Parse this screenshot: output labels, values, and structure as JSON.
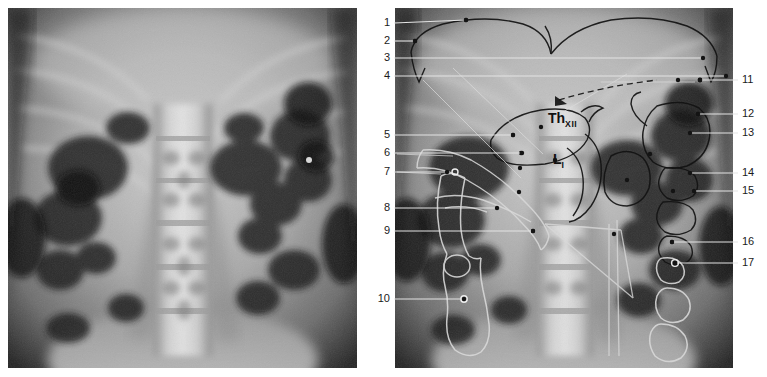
{
  "figure": {
    "type": "medical-radiograph-pair",
    "background_color": "#ffffff",
    "line_color": "#e8e8e8",
    "number_color": "#1b1b1b"
  },
  "panels": {
    "left": {
      "name": "plain-radiograph",
      "x": 8,
      "y": 8,
      "width": 349,
      "height": 360,
      "has_overlay": false
    },
    "right": {
      "name": "annotated-radiograph",
      "x": 395,
      "y": 8,
      "width": 338,
      "height": 360,
      "has_overlay": true
    }
  },
  "vertebral_labels": [
    {
      "id": "thxii",
      "base": "Th",
      "subscript": "XII",
      "x": 548,
      "y": 111
    },
    {
      "id": "li",
      "base": "L",
      "subscript": "I",
      "x": 553,
      "y": 152
    }
  ],
  "leader_labels": {
    "left_column": [
      {
        "number": "1",
        "num_x": 390,
        "num_y": 23,
        "line": [
          [
            394,
            23
          ],
          [
            466,
            20
          ]
        ],
        "dot": [
          466,
          20
        ]
      },
      {
        "number": "2",
        "num_x": 390,
        "num_y": 41,
        "line": [
          [
            394,
            41
          ],
          [
            415,
            41
          ]
        ],
        "dot": [
          415,
          41
        ]
      },
      {
        "number": "3",
        "num_x": 390,
        "num_y": 58,
        "line": [
          [
            394,
            58
          ],
          [
            703,
            58
          ]
        ],
        "dot": [
          703,
          58
        ]
      },
      {
        "number": "4",
        "num_x": 390,
        "num_y": 76,
        "line": [
          [
            394,
            76
          ],
          [
            726,
            76
          ]
        ],
        "dot": [
          726,
          76
        ]
      },
      {
        "number": "5",
        "num_x": 390,
        "num_y": 135,
        "line": [
          [
            394,
            135
          ],
          [
            513,
            135
          ]
        ],
        "dot": [
          513,
          135
        ]
      },
      {
        "number": "6",
        "num_x": 390,
        "num_y": 153,
        "line": [
          [
            394,
            153
          ],
          [
            522,
            153
          ]
        ],
        "dot": [
          522,
          153
        ]
      },
      {
        "number": "7",
        "num_x": 390,
        "num_y": 172,
        "line": [
          [
            394,
            172
          ],
          [
            447,
            172
          ]
        ],
        "dot": [
          447,
          172
        ]
      },
      {
        "number": "8",
        "num_x": 390,
        "num_y": 208,
        "line": [
          [
            394,
            208
          ],
          [
            497,
            208
          ]
        ],
        "dot": [
          497,
          208
        ]
      },
      {
        "number": "9",
        "num_x": 390,
        "num_y": 231,
        "line": [
          [
            394,
            231
          ],
          [
            533,
            231
          ]
        ],
        "dot": [
          533,
          231
        ]
      },
      {
        "number": "10",
        "num_x": 390,
        "num_y": 299,
        "line": [
          [
            394,
            299
          ],
          [
            464,
            299
          ]
        ],
        "dot": [
          464,
          299
        ]
      }
    ],
    "right_column": [
      {
        "number": "11",
        "num_x": 742,
        "num_y": 80,
        "line": [
          [
            738,
            80
          ],
          [
            700,
            80
          ]
        ],
        "dot": [
          700,
          80
        ]
      },
      {
        "number": "12",
        "num_x": 742,
        "num_y": 114,
        "line": [
          [
            738,
            114
          ],
          [
            698,
            114
          ]
        ],
        "dot": [
          698,
          114
        ]
      },
      {
        "number": "13",
        "num_x": 742,
        "num_y": 133,
        "line": [
          [
            738,
            133
          ],
          [
            690,
            133
          ]
        ],
        "dot": [
          690,
          133
        ]
      },
      {
        "number": "14",
        "num_x": 742,
        "num_y": 173,
        "line": [
          [
            738,
            173
          ],
          [
            690,
            173
          ]
        ],
        "dot": [
          690,
          173
        ]
      },
      {
        "number": "15",
        "num_x": 742,
        "num_y": 191,
        "line": [
          [
            738,
            191
          ],
          [
            694,
            191
          ]
        ],
        "dot": [
          694,
          191
        ]
      },
      {
        "number": "16",
        "num_x": 742,
        "num_y": 242,
        "line": [
          [
            738,
            242
          ],
          [
            672,
            242
          ]
        ],
        "dot": [
          672,
          242
        ]
      },
      {
        "number": "17",
        "num_x": 742,
        "num_y": 263,
        "line": [
          [
            738,
            263
          ],
          [
            675,
            263
          ]
        ],
        "dot": [
          675,
          263
        ]
      }
    ]
  }
}
